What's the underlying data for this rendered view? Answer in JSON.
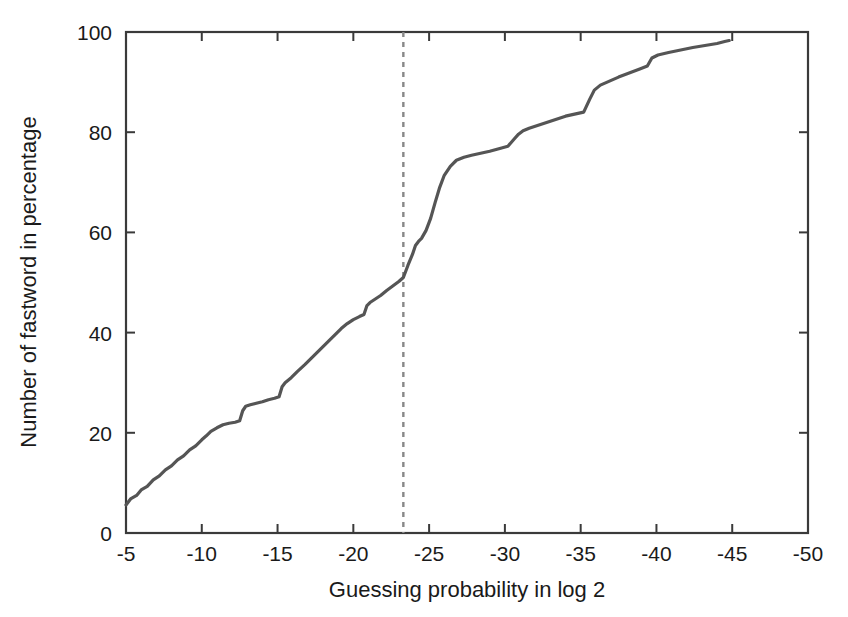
{
  "chart_data": {
    "type": "line",
    "title": "",
    "subtitle": "",
    "xlabel": "Guessing probability in log 2",
    "ylabel": "Number of fastword in percentage",
    "xlim": [
      -5,
      -50
    ],
    "ylim": [
      0,
      100
    ],
    "x_ticks": [
      -5,
      -10,
      -15,
      -20,
      -25,
      -30,
      -35,
      -40,
      -45,
      -50
    ],
    "x_tick_labels": [
      "-5",
      "-10",
      "-15",
      "-20",
      "-25",
      "-30",
      "-35",
      "-40",
      "-45",
      "-50"
    ],
    "y_ticks": [
      0,
      20,
      40,
      60,
      80,
      100
    ],
    "y_tick_labels": [
      "0",
      "20",
      "40",
      "60",
      "80",
      "100"
    ],
    "grid": false,
    "legend": null,
    "legend_position": "none",
    "x_axis_direction": "decreasing",
    "line_color": "#555555",
    "axis_color": "#3a3a3a",
    "background_color": "#ffffff",
    "annotations": [
      {
        "name": "threshold-line",
        "type": "vertical-dashed-line",
        "x": -23.3,
        "color": "#888888",
        "label": ""
      }
    ],
    "series": [
      {
        "name": "cumulative fastword percentage",
        "color": "#555555",
        "x": [
          -5.0,
          -5.3,
          -5.7,
          -6.0,
          -6.4,
          -6.8,
          -7.2,
          -7.6,
          -8.0,
          -8.4,
          -8.8,
          -9.2,
          -9.6,
          -10.0,
          -10.3,
          -10.6,
          -11.0,
          -11.4,
          -11.8,
          -12.2,
          -12.5,
          -12.7,
          -12.9,
          -13.2,
          -13.6,
          -14.0,
          -14.4,
          -14.8,
          -15.1,
          -15.3,
          -15.5,
          -15.9,
          -16.3,
          -16.8,
          -17.2,
          -17.6,
          -18.0,
          -18.4,
          -18.8,
          -19.2,
          -19.6,
          -20.0,
          -20.4,
          -20.7,
          -20.9,
          -21.1,
          -21.4,
          -21.8,
          -22.2,
          -22.6,
          -23.0,
          -23.3,
          -23.6,
          -23.9,
          -24.1,
          -24.3,
          -24.5,
          -24.8,
          -25.1,
          -25.4,
          -25.7,
          -26.0,
          -26.4,
          -26.8,
          -27.3,
          -27.8,
          -28.4,
          -29.0,
          -29.6,
          -30.2,
          -30.6,
          -30.9,
          -31.2,
          -31.6,
          -32.2,
          -32.8,
          -33.4,
          -34.0,
          -34.6,
          -35.2,
          -35.6,
          -35.9,
          -36.3,
          -36.9,
          -37.5,
          -38.2,
          -38.9,
          -39.4,
          -39.7,
          -40.1,
          -40.8,
          -41.6,
          -42.4,
          -43.2,
          -44.0,
          -44.5,
          -44.8
        ],
        "y": [
          5.6,
          6.8,
          7.5,
          8.6,
          9.3,
          10.6,
          11.4,
          12.6,
          13.4,
          14.6,
          15.4,
          16.6,
          17.4,
          18.6,
          19.4,
          20.3,
          21.0,
          21.6,
          21.9,
          22.1,
          22.4,
          24.4,
          25.3,
          25.6,
          25.9,
          26.2,
          26.6,
          26.9,
          27.2,
          29.2,
          30.0,
          31.0,
          32.2,
          33.6,
          34.8,
          36.0,
          37.2,
          38.4,
          39.6,
          40.8,
          41.8,
          42.6,
          43.2,
          43.6,
          45.4,
          46.0,
          46.6,
          47.4,
          48.4,
          49.3,
          50.2,
          51.0,
          53.4,
          55.6,
          57.4,
          58.2,
          58.8,
          60.4,
          62.8,
          66.0,
          69.0,
          71.4,
          73.2,
          74.4,
          75.0,
          75.4,
          75.8,
          76.2,
          76.7,
          77.2,
          78.6,
          79.6,
          80.3,
          80.8,
          81.4,
          82.0,
          82.6,
          83.2,
          83.6,
          84.0,
          86.6,
          88.4,
          89.4,
          90.2,
          91.0,
          91.8,
          92.6,
          93.2,
          94.8,
          95.4,
          95.9,
          96.4,
          96.9,
          97.3,
          97.7,
          98.1,
          98.3
        ]
      }
    ]
  }
}
